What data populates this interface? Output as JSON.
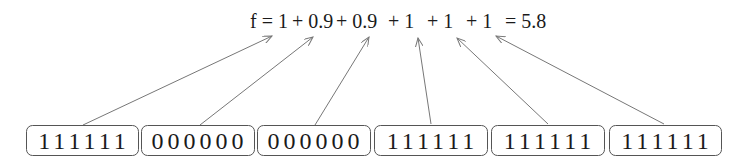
{
  "formula": {
    "terms": [
      {
        "text": "f = 1",
        "x": 250
      },
      {
        "text": "+ 0.9",
        "x": 292
      },
      {
        "text": "+ 0.9",
        "x": 336
      },
      {
        "text": "+ 1",
        "x": 388
      },
      {
        "text": "+ 1",
        "x": 427
      },
      {
        "text": "+ 1",
        "x": 466
      },
      {
        "text": "= 5.8",
        "x": 505
      }
    ],
    "full_text": "f = 1 + 0.9 + 0.9 + 1 + 1 + 1 = 5.8",
    "result": "5.8"
  },
  "blocks": [
    {
      "bits": "111111",
      "x": 26,
      "width": 112,
      "score": "1",
      "arrow": {
        "x1": 83,
        "y1": 125,
        "x2": 272,
        "y2": 36
      }
    },
    {
      "bits": "000000",
      "x": 141,
      "width": 113,
      "score": "0.9",
      "arrow": {
        "x1": 200,
        "y1": 125,
        "x2": 313,
        "y2": 37
      }
    },
    {
      "bits": "000000",
      "x": 257,
      "width": 113,
      "score": "0.9",
      "arrow": {
        "x1": 315,
        "y1": 125,
        "x2": 369,
        "y2": 37
      }
    },
    {
      "bits": "111111",
      "x": 374,
      "width": 113,
      "score": "1",
      "arrow": {
        "x1": 431,
        "y1": 124,
        "x2": 418,
        "y2": 38
      }
    },
    {
      "bits": "111111",
      "x": 491,
      "width": 113,
      "score": "1",
      "arrow": {
        "x1": 548,
        "y1": 124,
        "x2": 457,
        "y2": 38
      }
    },
    {
      "bits": "111111",
      "x": 609,
      "width": 112,
      "score": "1",
      "arrow": {
        "x1": 664,
        "y1": 124,
        "x2": 496,
        "y2": 36
      }
    }
  ],
  "colors": {
    "text": "#1a1a1a",
    "box_stroke": "#555555",
    "arrow": "#777777"
  }
}
